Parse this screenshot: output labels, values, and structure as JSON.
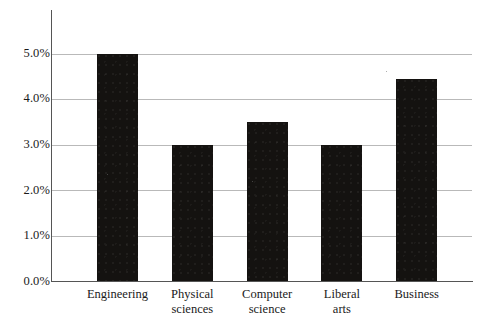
{
  "chart_data": {
    "type": "bar",
    "title": "",
    "subtitle": "",
    "xlabel": "",
    "ylabel": "",
    "categories": [
      "Engineering",
      "Physical sciences",
      "Computer science",
      "Liberal arts",
      "Business"
    ],
    "category_lines": [
      [
        "Engineering"
      ],
      [
        "Physical",
        "sciences"
      ],
      [
        "Computer",
        "science"
      ],
      [
        "Liberal",
        "arts"
      ],
      [
        "Business"
      ]
    ],
    "values": [
      5.0,
      3.0,
      3.5,
      3.0,
      4.45
    ],
    "value_labels": [
      "5.0%",
      "3.0%",
      "3.5%",
      "3.0%",
      "4.45%"
    ],
    "ylim": [
      0,
      5.55
    ],
    "yticks": [
      0.0,
      1.0,
      2.0,
      3.0,
      4.0,
      5.0
    ],
    "ytick_labels": [
      "0.0%",
      "1.0%",
      "2.0%",
      "3.0%",
      "4.0%",
      "5.0%"
    ],
    "grid": true,
    "legend": "none",
    "bar_color": "#141210",
    "gridline_color": "#b9b9b9",
    "axis_color": "#555555",
    "background_color": "#ffffff"
  }
}
